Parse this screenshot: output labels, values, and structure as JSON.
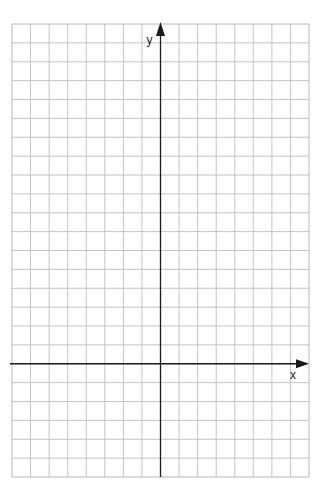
{
  "diagram": {
    "type": "coordinate-grid",
    "grid": {
      "left": 12,
      "top": 24,
      "right": 309,
      "bottom": 477,
      "columns": 16,
      "rows": 24,
      "line_color": "#c4c4c4",
      "border_color": "#b8b8b8"
    },
    "axes": {
      "color": "#1a1a1a",
      "y_axis_column": 8,
      "x_axis_row": 18,
      "x_label": "x",
      "y_label": "y"
    }
  }
}
